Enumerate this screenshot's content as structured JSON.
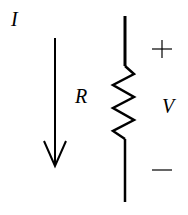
{
  "diagram": {
    "type": "circuit-element",
    "labels": {
      "current": "I",
      "resistance": "R",
      "voltage": "V"
    },
    "polarity": {
      "positive": "+",
      "negative": "−"
    },
    "colors": {
      "stroke": "#000000",
      "background": "#ffffff"
    }
  }
}
